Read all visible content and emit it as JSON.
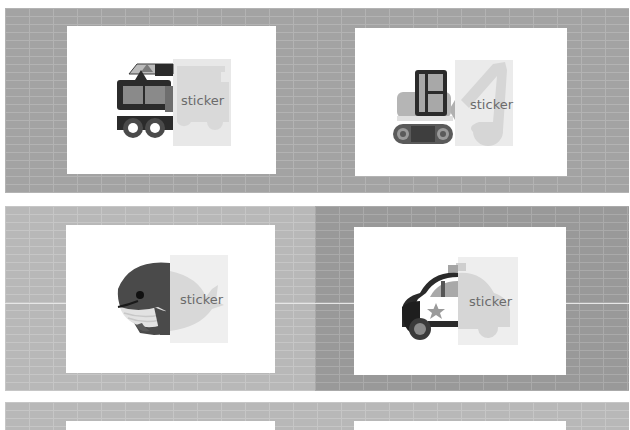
{
  "cards": [
    {
      "subject": "fire-truck",
      "label": "sticker"
    },
    {
      "subject": "excavator",
      "label": "sticker"
    },
    {
      "subject": "whale",
      "label": "sticker"
    },
    {
      "subject": "police-car",
      "label": "sticker"
    }
  ],
  "colors": {
    "brick": "#a3a3a3",
    "brick_light": "#b8b8b8",
    "brick_dark": "#999999",
    "card": "#ffffff",
    "sticker_overlay": "#e4e4e4",
    "label_text": "#6b6b6b",
    "icon_dark": "#2b2b2b",
    "icon_mid": "#5a5a5a",
    "icon_light": "#9a9a9a"
  }
}
